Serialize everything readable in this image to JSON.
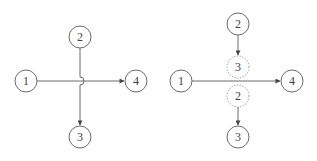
{
  "diagrams": [
    {
      "name": "crossing-with-hop",
      "nodes": [
        {
          "id": "n1",
          "label": "1",
          "x": 26,
          "y": 81,
          "style": "solid"
        },
        {
          "id": "n2",
          "label": "2",
          "x": 80,
          "y": 37,
          "style": "solid"
        },
        {
          "id": "n4",
          "label": "4",
          "x": 136,
          "y": 81,
          "style": "solid"
        },
        {
          "id": "n3",
          "label": "3",
          "x": 80,
          "y": 137,
          "style": "solid"
        }
      ],
      "edges": [
        {
          "from": "1",
          "to": "4",
          "arrow": true
        },
        {
          "from": "2",
          "to": "3",
          "arrow": true,
          "hop_over": true
        }
      ]
    },
    {
      "name": "crossing-split",
      "nodes": [
        {
          "id": "m1",
          "label": "1",
          "x": 181,
          "y": 81,
          "style": "solid"
        },
        {
          "id": "m2",
          "label": "2",
          "x": 238,
          "y": 24,
          "style": "solid"
        },
        {
          "id": "m3g",
          "label": "3",
          "x": 238,
          "y": 67,
          "style": "dashed"
        },
        {
          "id": "m2g",
          "label": "2",
          "x": 238,
          "y": 96,
          "style": "dashed"
        },
        {
          "id": "m4",
          "label": "4",
          "x": 292,
          "y": 81,
          "style": "solid"
        },
        {
          "id": "m3",
          "label": "3",
          "x": 238,
          "y": 137,
          "style": "solid"
        }
      ],
      "edges": [
        {
          "from": "1",
          "to": "4",
          "arrow": true
        },
        {
          "from": "2",
          "to": "3 (dashed)",
          "arrow": true
        },
        {
          "from": "2 (dashed)",
          "to": "3",
          "arrow": true
        }
      ]
    }
  ],
  "colors": {
    "stroke": "#6a6a6a",
    "text": "#444444",
    "background": "#ffffff"
  }
}
